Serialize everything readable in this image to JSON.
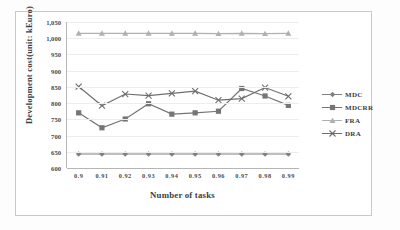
{
  "chart_data": {
    "type": "line",
    "title": "",
    "xlabel": "Number of tasks",
    "ylabel": "Development  cost(unit: kEuro)",
    "categories": [
      "0.9",
      "0.91",
      "0.92",
      "0.93",
      "0.94",
      "0.95",
      "0.96",
      "0.97",
      "0.98",
      "0.99"
    ],
    "ylim": [
      600,
      1050
    ],
    "yticks": [
      "600",
      "650",
      "700",
      "750",
      "800",
      "850",
      "900",
      "950",
      "1,000",
      "1,050"
    ],
    "ytick_values": [
      600,
      650,
      700,
      750,
      800,
      850,
      900,
      950,
      1000,
      1050
    ],
    "grid": true,
    "legend_position": "right",
    "series": [
      {
        "name": "MDC",
        "marker": "diamond",
        "color": "#808080",
        "values": [
          643,
          643,
          643,
          643,
          643,
          643,
          643,
          643,
          643,
          643
        ]
      },
      {
        "name": "MDCRR",
        "marker": "square",
        "color": "#757575",
        "values": [
          770,
          724,
          751,
          798,
          766,
          770,
          775,
          845,
          822,
          793
        ]
      },
      {
        "name": "FRA",
        "marker": "triangle",
        "color": "#b0b0b0",
        "values": [
          1015,
          1015,
          1015,
          1015,
          1015,
          1015,
          1014,
          1015,
          1014,
          1015
        ]
      },
      {
        "name": "DRA",
        "marker": "cross",
        "color": "#6e6e6e",
        "values": [
          851,
          792,
          828,
          823,
          830,
          837,
          809,
          814,
          848,
          821
        ]
      }
    ]
  }
}
